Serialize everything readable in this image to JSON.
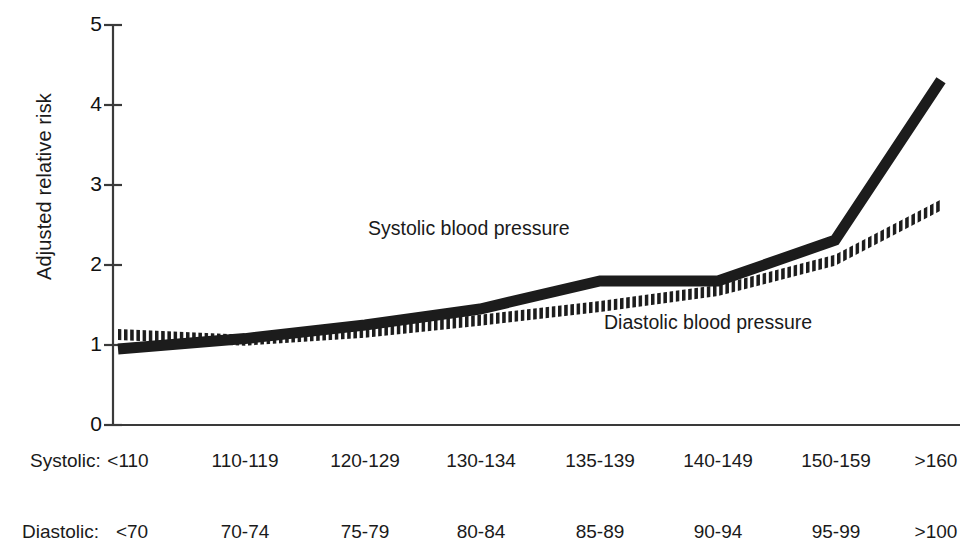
{
  "chart_data": {
    "type": "line",
    "title": "",
    "xlabel": "",
    "ylabel": "Adjusted relative risk",
    "ylim": [
      0,
      5
    ],
    "yticks": [
      0,
      1,
      2,
      3,
      4,
      5
    ],
    "ytick_labels": [
      "0",
      "1",
      "2",
      "3",
      "4",
      "5"
    ],
    "grid": false,
    "legend_position": "inline-annotation",
    "categories": [
      "<110",
      "110-119",
      "120-129",
      "130-134",
      "135-139",
      "140-149",
      "150-159",
      ">160"
    ],
    "categories_secondary": [
      "<70",
      "70-74",
      "75-79",
      "80-84",
      "85-89",
      "90-94",
      "95-99",
      ">100"
    ],
    "category_axis_label_primary": "Systolic:",
    "category_axis_label_secondary": "Diastolic:",
    "series": [
      {
        "name": "Systolic blood pressure",
        "style": "solid-thick",
        "color": "#1c1c1c",
        "values": [
          0.95,
          1.08,
          1.25,
          1.45,
          1.8,
          1.8,
          2.31,
          4.31
        ]
      },
      {
        "name": "Diastolic blood pressure",
        "style": "hatched",
        "color": "#1c1c1c",
        "values": [
          1.13,
          1.06,
          1.16,
          1.31,
          1.48,
          1.68,
          2.06,
          2.75
        ]
      }
    ],
    "annotations": [
      {
        "text": "Systolic blood pressure",
        "x": 2.9,
        "y": 2.55
      },
      {
        "text": "Diastolic blood pressure",
        "x": 5.1,
        "y": 1.35
      }
    ]
  },
  "axis": {
    "y_title": "Adjusted relative risk",
    "y_ticks": [
      "5",
      "4",
      "3",
      "2",
      "1",
      "0"
    ]
  },
  "annotations": {
    "systolic": "Systolic blood pressure",
    "diastolic": "Diastolic blood pressure"
  },
  "category_axis": {
    "systolic_label": "Systolic:",
    "diastolic_label": "Diastolic:",
    "systolic_values": [
      "<110",
      "110-119",
      "120-129",
      "130-134",
      "135-139",
      "140-149",
      "150-159",
      ">160"
    ],
    "diastolic_values": [
      "<70",
      "70-74",
      "75-79",
      "80-84",
      "85-89",
      "90-94",
      "95-99",
      ">100"
    ]
  },
  "colors": {
    "ink": "#1c1c1c",
    "axis": "#3a3a3a",
    "background": "#ffffff"
  }
}
